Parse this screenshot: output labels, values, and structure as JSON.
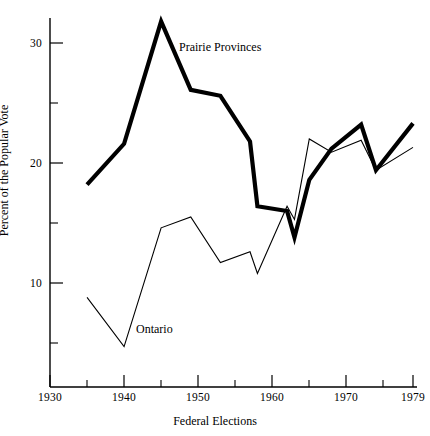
{
  "chart_data": {
    "type": "line",
    "title": "",
    "xlabel": "Federal Elections",
    "ylabel": "Percent of the Popular Vote",
    "xlim": [
      1930,
      1981
    ],
    "ylim": [
      2,
      33
    ],
    "grid": false,
    "legend_position": "inline-annotations",
    "x_major_ticks": [
      1930,
      1940,
      1950,
      1960,
      1970,
      1979
    ],
    "x_major_tick_labels": [
      "1930",
      "1940",
      "1950",
      "1960",
      "1970",
      "1979"
    ],
    "x_minor_ticks": [
      1935,
      1945,
      1955,
      1965,
      1975
    ],
    "y_major_ticks": [
      10,
      20,
      30
    ],
    "y_major_tick_labels": [
      "10",
      "20",
      "30"
    ],
    "y_minor_ticks": [
      5,
      15,
      25
    ],
    "x": [
      1935,
      1940,
      1945,
      1949,
      1953,
      1957,
      1958,
      1962,
      1963,
      1965,
      1968,
      1972,
      1974,
      1979
    ],
    "series": [
      {
        "name": "Prairie Provinces",
        "line_weight": "thick",
        "color": "#000000",
        "values": [
          18.2,
          21.6,
          31.8,
          26.1,
          25.6,
          21.8,
          16.4,
          16.0,
          13.8,
          18.6,
          21.2,
          23.2,
          19.4,
          23.3
        ]
      },
      {
        "name": "Ontario",
        "line_weight": "thin",
        "color": "#000000",
        "values": [
          8.8,
          4.7,
          14.6,
          15.5,
          11.7,
          12.6,
          10.8,
          16.4,
          15.3,
          22.0,
          20.9,
          21.9,
          19.4,
          21.3
        ]
      }
    ],
    "annotations": [
      {
        "text": "Prairie Provinces",
        "x": 1947.5,
        "y": 29.8
      },
      {
        "text": "Ontario",
        "x": 1941.5,
        "y": 6.1
      }
    ]
  },
  "axes": {
    "x_title": "Federal Elections",
    "y_title": "Percent of the Popular Vote",
    "x_labels": [
      "1930",
      "1940",
      "1950",
      "1960",
      "1970",
      "1979"
    ],
    "y_labels": [
      "10",
      "20",
      "30"
    ]
  },
  "labels": {
    "prairie": "Prairie Provinces",
    "ontario": "Ontario"
  },
  "colors": {
    "ink": "#000000",
    "background": "#ffffff"
  }
}
